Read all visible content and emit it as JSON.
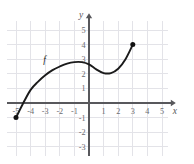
{
  "chart_data": {
    "type": "line",
    "title": "",
    "xlabel": "x",
    "ylabel": "y",
    "curve_label": "f",
    "grid": true,
    "legend_position": "none",
    "xlim": [
      -5.6,
      5.4
    ],
    "ylim": [
      -3.6,
      5.6
    ],
    "x_ticks": [
      -5,
      -4,
      -3,
      -2,
      -1,
      1,
      2,
      3,
      4,
      5
    ],
    "y_ticks": [
      5,
      4,
      3,
      2,
      1,
      -1,
      -2,
      -3
    ],
    "x_tick_labels": [
      "-5",
      "-4",
      "-3",
      "-2",
      "-1",
      "1",
      "2",
      "3",
      "4",
      "5"
    ],
    "y_tick_labels": [
      "5",
      "4",
      "3",
      "2",
      "1",
      "-1",
      "-2",
      "-3"
    ],
    "x": [
      -5,
      -4.5,
      -4,
      -3.5,
      -3,
      -2.5,
      -2,
      -1.5,
      -1,
      -0.5,
      0,
      0.5,
      1,
      1.5,
      2,
      2.5,
      3
    ],
    "values": [
      -1,
      0.0,
      0.9,
      1.45,
      1.9,
      2.25,
      2.5,
      2.7,
      2.8,
      2.8,
      2.65,
      2.3,
      2.05,
      2.05,
      2.35,
      3.0,
      4.0
    ],
    "endpoints": [
      {
        "name": "left-endpoint",
        "x": -5,
        "y": -1,
        "style": "filled"
      },
      {
        "name": "right-endpoint",
        "x": 3,
        "y": 4,
        "style": "filled"
      }
    ],
    "annotations": [
      {
        "name": "curve-label-f",
        "text": "f",
        "x": -3.05,
        "y": 2.75
      }
    ]
  },
  "axes": {
    "x_axis_name": "x",
    "y_axis_name": "y"
  }
}
